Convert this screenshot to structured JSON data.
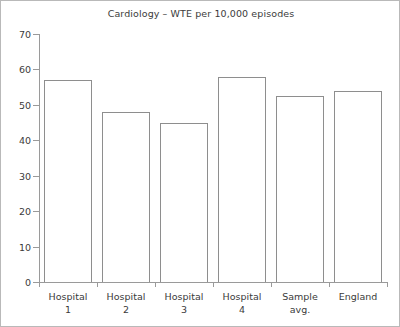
{
  "chart_data": {
    "type": "bar",
    "title": "Cardiology – WTE per 10,000 episodes",
    "xlabel": "",
    "ylabel": "",
    "categories": [
      "Hospital\n1",
      "Hospital\n2",
      "Hospital\n3",
      "Hospital\n4",
      "Sample\navg.",
      "England"
    ],
    "values": [
      57,
      48,
      45,
      58,
      52.5,
      54
    ],
    "ylim": [
      0,
      70
    ],
    "yticks": [
      0,
      10,
      20,
      30,
      40,
      50,
      60,
      70
    ],
    "ytick_labels": [
      "0",
      "10",
      "20",
      "30",
      "40",
      "50",
      "60",
      "70"
    ],
    "grid": false,
    "legend": null,
    "bar_fill_color": "#ffffff",
    "bar_edge_color": "#8e8e8e",
    "axis_color": "#9a9a9a",
    "text_color": "#3b3b3b",
    "background_color": "#ffffff",
    "border_color": "#b9b9b9"
  }
}
